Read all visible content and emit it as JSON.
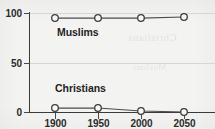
{
  "chart_data": {
    "type": "line",
    "title": "",
    "subtitle": "",
    "xlabel": "",
    "ylabel": "",
    "x": [
      1900,
      1950,
      2000,
      2050
    ],
    "xtick_labels": [
      "1900",
      "1950",
      "2000",
      "2050"
    ],
    "ytick_labels": [
      "0",
      "50",
      "100"
    ],
    "yticks": [
      0,
      50,
      100
    ],
    "ylim": [
      0,
      100
    ],
    "xlim": [
      1880,
      2065
    ],
    "grid": true,
    "grid_axis": "y",
    "legend": "inline-labels",
    "legend_position": "inside-plot",
    "marker": "open-circle",
    "series": [
      {
        "name": "Muslims",
        "label": "Muslims",
        "values": [
          95,
          95,
          95,
          96
        ]
      },
      {
        "name": "Christians",
        "label": "Christians",
        "values": [
          5,
          5,
          2,
          1
        ]
      }
    ],
    "annotations": [
      {
        "text": "Muslims",
        "x": 1925,
        "y": 80
      },
      {
        "text": "Christians",
        "x": 1925,
        "y": 18
      }
    ],
    "colors": {
      "line": "#4c4c4c",
      "marker_fill": "#f7f7f5",
      "marker_stroke": "#3d3d3d",
      "axis": "#3a3a3a",
      "grid": "#d6d6d4",
      "text": "#2b2b2b",
      "background": "#f3f3f1"
    }
  },
  "axis": {
    "y_ticks": [
      {
        "label": "100",
        "value": 100
      },
      {
        "label": "50",
        "value": 50
      },
      {
        "label": "0",
        "value": 0
      }
    ],
    "x_ticks": [
      {
        "label": "1900",
        "value": 1900
      },
      {
        "label": "1950",
        "value": 1950
      },
      {
        "label": "2000",
        "value": 2000
      },
      {
        "label": "2050",
        "value": 2050
      }
    ]
  },
  "background_artifacts": {
    "ghost_line_1": "Christians",
    "ghost_line_2": "Muslims"
  }
}
